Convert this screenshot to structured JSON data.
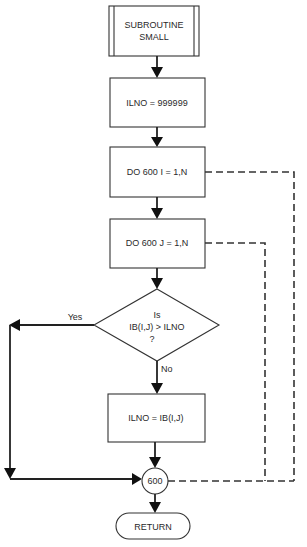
{
  "diagram": {
    "type": "flowchart",
    "nodes": {
      "start": {
        "shape": "predefined-process",
        "lines": [
          "SUBROUTINE",
          "SMALL"
        ]
      },
      "init": {
        "shape": "process",
        "label": "ILNO = 999999"
      },
      "loop_i": {
        "shape": "process",
        "label": "DO 600 I = 1,N"
      },
      "loop_j": {
        "shape": "process",
        "label": "DO 600 J = 1,N"
      },
      "decision": {
        "shape": "decision",
        "lines": [
          "Is",
          "IB(I,J) > ILNO",
          "?"
        ]
      },
      "assign": {
        "shape": "process",
        "label": "ILNO = IB(I,J)"
      },
      "connector": {
        "shape": "connector",
        "label": "600"
      },
      "end": {
        "shape": "terminator",
        "label": "RETURN"
      }
    },
    "edges": {
      "yes_label": "Yes",
      "no_label": "No"
    },
    "colors": {
      "stroke": "#333333",
      "text": "#2a2a2a",
      "background": "#ffffff"
    }
  }
}
